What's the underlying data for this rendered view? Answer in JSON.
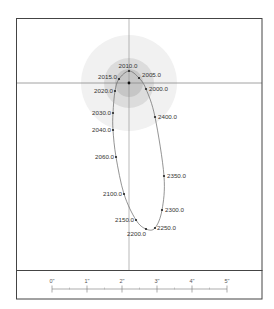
{
  "diagram": {
    "type": "binary-star-orbit",
    "center": {
      "x": 129,
      "y": 83
    },
    "halo_circles": [
      {
        "r": 48,
        "color": "#f1f1f1"
      },
      {
        "r": 25,
        "color": "#dcdcdc"
      },
      {
        "r": 14,
        "color": "#c6c6c6"
      }
    ],
    "orbit_points": [
      {
        "label": "2000.0",
        "x": 146,
        "y": 89,
        "anchor": "start",
        "dx": 3,
        "dy": 2
      },
      {
        "label": "2005.0",
        "x": 139,
        "y": 78,
        "anchor": "start",
        "dx": 3,
        "dy": -1
      },
      {
        "label": "2010.0",
        "x": 129,
        "y": 71,
        "anchor": "middle",
        "dx": -1,
        "dy": -3
      },
      {
        "label": "2015.0",
        "x": 119,
        "y": 79,
        "anchor": "end",
        "dx": -2,
        "dy": 0
      },
      {
        "label": "2020.0",
        "x": 115,
        "y": 91,
        "anchor": "end",
        "dx": -2,
        "dy": 2
      },
      {
        "label": "2030.0",
        "x": 113,
        "y": 113,
        "anchor": "end",
        "dx": -2,
        "dy": 2
      },
      {
        "label": "2040.0",
        "x": 113,
        "y": 130,
        "anchor": "end",
        "dx": -2,
        "dy": 2
      },
      {
        "label": "2060.0",
        "x": 116,
        "y": 157,
        "anchor": "end",
        "dx": -2,
        "dy": 2
      },
      {
        "label": "2100.0",
        "x": 124,
        "y": 194,
        "anchor": "end",
        "dx": -2,
        "dy": 2
      },
      {
        "label": "2150.0",
        "x": 136,
        "y": 220,
        "anchor": "end",
        "dx": -2,
        "dy": 2
      },
      {
        "label": "2200.0",
        "x": 146,
        "y": 229,
        "anchor": "end",
        "dx": 0,
        "dy": 7
      },
      {
        "label": "2250.0",
        "x": 155,
        "y": 228,
        "anchor": "start",
        "dx": 2,
        "dy": 2
      },
      {
        "label": "2300.0",
        "x": 162,
        "y": 210,
        "anchor": "start",
        "dx": 3,
        "dy": 2
      },
      {
        "label": "2350.0",
        "x": 164,
        "y": 176,
        "anchor": "start",
        "dx": 3,
        "dy": 2
      },
      {
        "label": "2400.0",
        "x": 155,
        "y": 117,
        "anchor": "start",
        "dx": 3,
        "dy": 2
      }
    ],
    "scale_bar": {
      "labels": [
        "0\"",
        "1\"",
        "2\"",
        "3\"",
        "4\"",
        "5\""
      ],
      "x_start": 52,
      "x_step": 35,
      "y": 289
    }
  }
}
